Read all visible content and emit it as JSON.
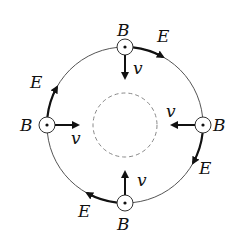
{
  "diagram": {
    "labels": {
      "b_top": "B",
      "b_left": "B",
      "b_right": "B",
      "b_bottom": "B",
      "e_top": "E",
      "e_left": "E",
      "e_right": "E",
      "e_bottom": "E",
      "v_top": "v",
      "v_left": "v",
      "v_right": "v",
      "v_bottom": "v"
    },
    "colors": {
      "line": "#111111",
      "thin": "#555555",
      "dashed": "#888888"
    }
  }
}
